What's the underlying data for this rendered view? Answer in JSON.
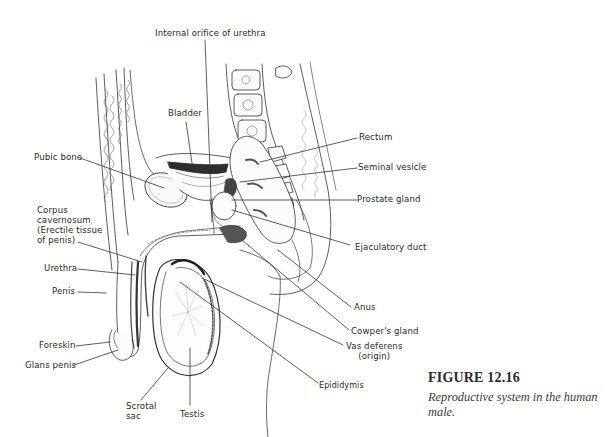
{
  "figure": {
    "number": "FIGURE 12.16",
    "caption": "Reproductive system in the human male."
  },
  "labels": {
    "internal_orifice": "Internal orifice of urethra",
    "bladder": "Bladder",
    "pubic_bone": "Pubic bone",
    "corpus_cavernosum": [
      "Corpus",
      "cavernosum",
      "(Erectile tissue",
      "of penis)"
    ],
    "urethra": "Urethra",
    "penis": "Penis",
    "foreskin": "Foreskin",
    "glans_penis": "Glans penis",
    "scrotal_sac": [
      "Scrotal",
      "sac"
    ],
    "testis": "Testis",
    "rectum": "Rectum",
    "seminal_vesicle": "Seminal vesicle",
    "prostate_gland": "Prostate gland",
    "ejaculatory_duct": "Ejaculatory duct",
    "anus": "Anus",
    "cowpers_gland": "Cowper's gland",
    "vas_deferens": [
      "Vas deferens",
      "(origin)"
    ],
    "epididymis": "Epididymis"
  },
  "colors": {
    "ink": "#2a2a2a",
    "shade": "#555555",
    "background": "#ffffff"
  }
}
